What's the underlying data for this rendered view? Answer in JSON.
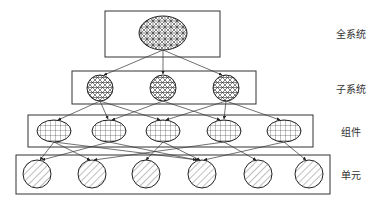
{
  "diagram": {
    "type": "hierarchy",
    "line_color": "#333333",
    "background": "#ffffff",
    "levels": [
      {
        "id": "system",
        "label": "全系统",
        "node_count": 1,
        "pattern": "crosshatch-dense",
        "shape": "ellipse"
      },
      {
        "id": "subsystem",
        "label": "子系统",
        "node_count": 3,
        "pattern": "crosshatch",
        "shape": "circle"
      },
      {
        "id": "component",
        "label": "组件",
        "node_count": 5,
        "pattern": "grid",
        "shape": "ellipse"
      },
      {
        "id": "unit",
        "label": "单元",
        "node_count": 6,
        "pattern": "diagonal-hatch",
        "shape": "circle"
      }
    ],
    "edges": {
      "system_to_subsystem": [
        [
          0,
          0
        ],
        [
          0,
          1
        ],
        [
          0,
          2
        ]
      ],
      "subsystem_to_component": [
        [
          0,
          0
        ],
        [
          0,
          1
        ],
        [
          0,
          2
        ],
        [
          1,
          1
        ],
        [
          1,
          3
        ],
        [
          2,
          2
        ],
        [
          2,
          3
        ],
        [
          2,
          4
        ]
      ],
      "component_to_unit": [
        [
          0,
          0
        ],
        [
          0,
          1
        ],
        [
          0,
          3
        ],
        [
          1,
          0
        ],
        [
          1,
          3
        ],
        [
          2,
          2
        ],
        [
          2,
          3
        ],
        [
          3,
          1
        ],
        [
          3,
          4
        ],
        [
          4,
          3
        ],
        [
          4,
          5
        ]
      ]
    }
  }
}
